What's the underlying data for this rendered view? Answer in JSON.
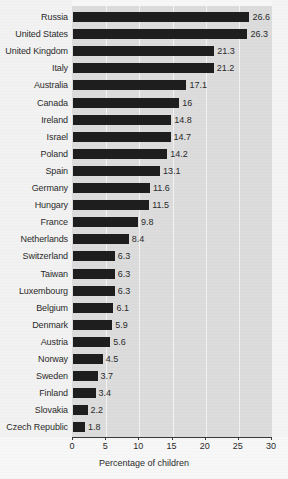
{
  "chart_data": {
    "type": "bar",
    "orientation": "horizontal",
    "title": "",
    "subtitle": "",
    "xlabel": "Percentage of children",
    "ylabel": "",
    "xlim": [
      0,
      30
    ],
    "xticks": [
      0,
      5,
      10,
      15,
      20,
      25,
      30
    ],
    "xtick_labels": [
      "0",
      "5",
      "10",
      "15",
      "20",
      "25",
      "30"
    ],
    "grid": "vertical-white",
    "legend": null,
    "categories": [
      "Russia",
      "United States",
      "United Kingdom",
      "Italy",
      "Australia",
      "Canada",
      "Ireland",
      "Israel",
      "Poland",
      "Spain",
      "Germany",
      "Hungary",
      "France",
      "Netherlands",
      "Switzerland",
      "Taiwan",
      "Luxembourg",
      "Belgium",
      "Denmark",
      "Austria",
      "Norway",
      "Sweden",
      "Finland",
      "Slovakia",
      "Czech Republic"
    ],
    "values": [
      26.6,
      26.3,
      21.3,
      21.2,
      17.1,
      16,
      14.8,
      14.7,
      14.2,
      13.1,
      11.6,
      11.5,
      9.8,
      8.4,
      6.3,
      6.3,
      6.3,
      6.1,
      5.9,
      5.6,
      4.5,
      3.7,
      3.4,
      2.2,
      1.8
    ],
    "value_labels": [
      "26.6",
      "26.3",
      "21.3",
      "21.2",
      "17.1",
      "16",
      "14.8",
      "14.7",
      "14.2",
      "13.1",
      "11.6",
      "11.5",
      "9.8",
      "8.4",
      "6.3",
      "6.3",
      "6.3",
      "6.1",
      "5.9",
      "5.6",
      "4.5",
      "3.7",
      "3.4",
      "2.2",
      "1.8"
    ],
    "colors": {
      "bar": "#1e1e1e",
      "plot_background": "#dcdcdc",
      "figure_background": "#f7f7f7",
      "gridline": "#f3f3f3",
      "axis": "#3a3a3a",
      "text": "#2b2b2b"
    }
  }
}
